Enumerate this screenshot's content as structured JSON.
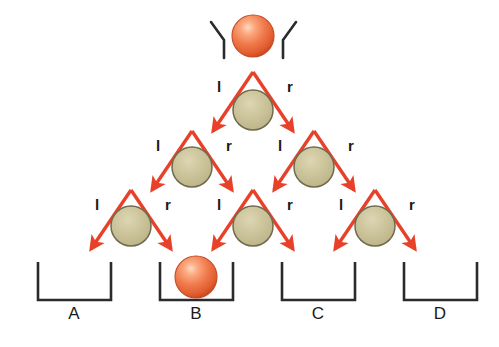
{
  "diagram": {
    "colors": {
      "arrow": "#e8412a",
      "arrow_dark": "#d6311c",
      "ball_fill": "#ee6f42",
      "ball_highlight": "#ffc9a8",
      "ball_edge": "#c24a22",
      "peg_fill": "#c8bf96",
      "peg_highlight": "#ded8b8",
      "peg_edge": "#6f6a4c",
      "bin_stroke": "#2b2b2b",
      "hopper_stroke": "#2b2b2b",
      "background": "#ffffff"
    },
    "geometry": {
      "width": 499,
      "height": 347,
      "peg_radius": 20,
      "ball_radius": 21,
      "row_spacing": 57,
      "column_spacing": 61
    }
  },
  "hopper": {
    "name": "funnel",
    "left_arm": {
      "x1": 211,
      "y1": 22,
      "x2": 224,
      "y2": 40,
      "x3": 224,
      "y3": 58
    },
    "right_arm": {
      "x1": 296,
      "y1": 22,
      "x2": 283,
      "y2": 40,
      "x3": 283,
      "y3": 58
    }
  },
  "balls": [
    {
      "name": "ball-source",
      "cx": 253,
      "cy": 36,
      "r": 21,
      "location": "top"
    },
    {
      "name": "ball-result",
      "cx": 196,
      "cy": 277,
      "r": 21,
      "location": "bin-B"
    }
  ],
  "pegs": [
    {
      "row": 1,
      "index": 0,
      "cx": 253,
      "cy": 110,
      "r": 20
    },
    {
      "row": 2,
      "index": 0,
      "cx": 192,
      "cy": 167,
      "r": 20
    },
    {
      "row": 2,
      "index": 1,
      "cx": 314,
      "cy": 167,
      "r": 20
    },
    {
      "row": 3,
      "index": 0,
      "cx": 131,
      "cy": 226,
      "r": 20
    },
    {
      "row": 3,
      "index": 1,
      "cx": 253,
      "cy": 226,
      "r": 20
    },
    {
      "row": 3,
      "index": 2,
      "cx": 375,
      "cy": 226,
      "r": 20
    }
  ],
  "arrows": [
    {
      "name": "arrow-r1-left",
      "x1": 253,
      "y1": 72,
      "x2": 213,
      "y2": 131
    },
    {
      "name": "arrow-r1-right",
      "x1": 253,
      "y1": 72,
      "x2": 293,
      "y2": 131
    },
    {
      "name": "arrow-r2a-left",
      "x1": 192,
      "y1": 131,
      "x2": 152,
      "y2": 190
    },
    {
      "name": "arrow-r2a-right",
      "x1": 192,
      "y1": 131,
      "x2": 232,
      "y2": 190
    },
    {
      "name": "arrow-r2b-left",
      "x1": 314,
      "y1": 131,
      "x2": 274,
      "y2": 190
    },
    {
      "name": "arrow-r2b-right",
      "x1": 314,
      "y1": 131,
      "x2": 354,
      "y2": 190
    },
    {
      "name": "arrow-r3a-left",
      "x1": 131,
      "y1": 190,
      "x2": 91,
      "y2": 249
    },
    {
      "name": "arrow-r3a-right",
      "x1": 131,
      "y1": 190,
      "x2": 171,
      "y2": 249
    },
    {
      "name": "arrow-r3b-left",
      "x1": 253,
      "y1": 190,
      "x2": 213,
      "y2": 249
    },
    {
      "name": "arrow-r3b-right",
      "x1": 253,
      "y1": 190,
      "x2": 293,
      "y2": 249
    },
    {
      "name": "arrow-r3c-left",
      "x1": 375,
      "y1": 190,
      "x2": 335,
      "y2": 249
    },
    {
      "name": "arrow-r3c-right",
      "x1": 375,
      "y1": 190,
      "x2": 415,
      "y2": 249
    }
  ],
  "branch_labels": [
    {
      "name": "label-r1-l",
      "text": "l",
      "x": 219,
      "y": 86
    },
    {
      "name": "label-r1-r",
      "text": "r",
      "x": 290,
      "y": 86
    },
    {
      "name": "label-r2a-l",
      "text": "l",
      "x": 158,
      "y": 145
    },
    {
      "name": "label-r2a-r",
      "text": "r",
      "x": 229,
      "y": 145
    },
    {
      "name": "label-r2b-l",
      "text": "l",
      "x": 280,
      "y": 145
    },
    {
      "name": "label-r2b-r",
      "text": "r",
      "x": 351,
      "y": 145
    },
    {
      "name": "label-r3a-l",
      "text": "l",
      "x": 97,
      "y": 204
    },
    {
      "name": "label-r3a-r",
      "text": "r",
      "x": 168,
      "y": 204
    },
    {
      "name": "label-r3b-l",
      "text": "l",
      "x": 219,
      "y": 204
    },
    {
      "name": "label-r3b-r",
      "text": "r",
      "x": 290,
      "y": 204
    },
    {
      "name": "label-r3c-l",
      "text": "l",
      "x": 341,
      "y": 204
    },
    {
      "name": "label-r3c-r",
      "text": "r",
      "x": 412,
      "y": 204
    }
  ],
  "bins": [
    {
      "name": "bin-a",
      "label": "A",
      "left": 38,
      "right": 111,
      "top": 262,
      "bottom": 300,
      "label_x": 74,
      "label_y": 313,
      "contains_ball": false
    },
    {
      "name": "bin-b",
      "label": "B",
      "left": 160,
      "right": 233,
      "top": 262,
      "bottom": 300,
      "label_x": 196,
      "label_y": 313,
      "contains_ball": true
    },
    {
      "name": "bin-c",
      "label": "C",
      "left": 282,
      "right": 355,
      "top": 262,
      "bottom": 300,
      "label_x": 318,
      "label_y": 313,
      "contains_ball": false
    },
    {
      "name": "bin-d",
      "label": "D",
      "left": 404,
      "right": 477,
      "top": 262,
      "bottom": 300,
      "label_x": 440,
      "label_y": 313,
      "contains_ball": false
    }
  ]
}
